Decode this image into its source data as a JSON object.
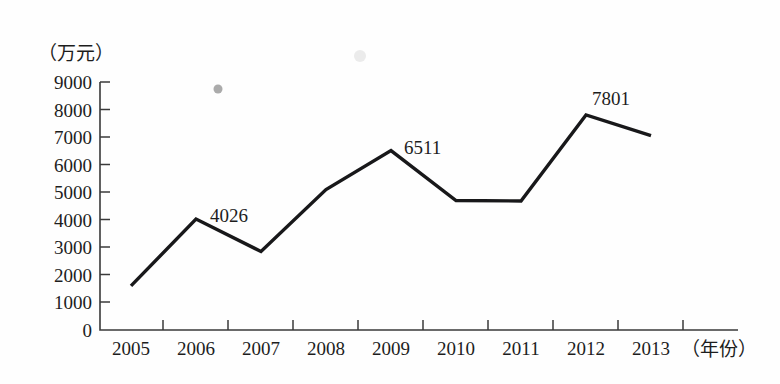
{
  "figure": {
    "y_axis_unit": "（万元）",
    "x_axis_unit": "（年份）"
  },
  "chart_data": {
    "type": "line",
    "title": "",
    "xlabel": "（年份）",
    "ylabel": "（万元）",
    "categories": [
      "2005",
      "2006",
      "2007",
      "2008",
      "2009",
      "2010",
      "2011",
      "2012",
      "2013"
    ],
    "values": [
      1600,
      4026,
      2850,
      5100,
      6511,
      4700,
      4680,
      7801,
      7050
    ],
    "point_labels": [
      {
        "category": "2006",
        "text": "4026"
      },
      {
        "category": "2009",
        "text": "6511"
      },
      {
        "category": "2012",
        "text": "7801"
      }
    ],
    "ylim": [
      0,
      9000
    ],
    "ytick_labels": [
      "0",
      "1000",
      "2000",
      "3000",
      "4000",
      "5000",
      "6000",
      "7000",
      "8000",
      "9000"
    ],
    "ytick_values": [
      0,
      1000,
      2000,
      3000,
      4000,
      5000,
      6000,
      7000,
      8000,
      9000
    ],
    "xtick_labels": [
      "2005",
      "2006",
      "2007",
      "2008",
      "2009",
      "2010",
      "2011",
      "2012",
      "2013"
    ],
    "grid": false,
    "legend": null,
    "series": [
      {
        "name": "",
        "values": [
          1600,
          4026,
          2850,
          5100,
          6511,
          4700,
          4680,
          7801,
          7050
        ]
      }
    ],
    "line_color": "#18181a"
  }
}
